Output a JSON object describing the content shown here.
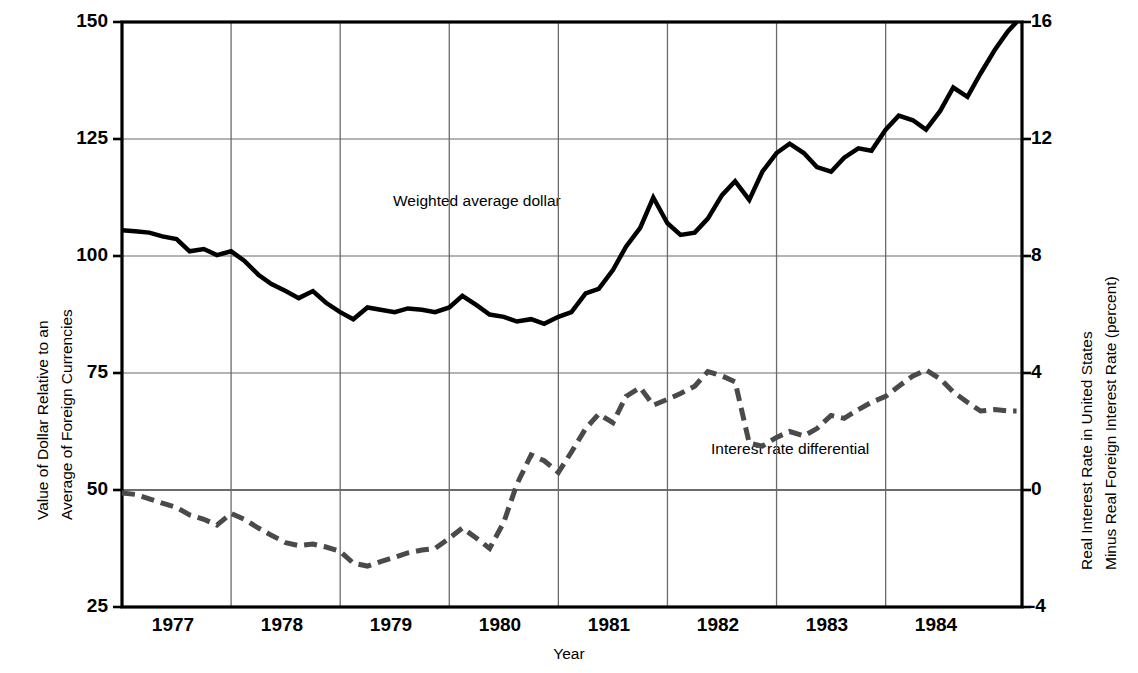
{
  "chart_data": {
    "type": "line",
    "title": "",
    "xlabel": "Year",
    "ylabel_left": "Value of Dollar Relative to an Average of Foreign Currencies",
    "ylabel_left_line1": "Value of Dollar Relative to an",
    "ylabel_left_line2": "Average of Foreign Currencies",
    "ylabel_right": "Real Interest Rate in United States Minus Real Foreign Interest Rate (percent)",
    "ylabel_right_line1": "Real Interest Rate in United States",
    "ylabel_right_line2": "Minus Real Foreign Interest Rate (percent)",
    "xlim": [
      1976.5,
      1984.75
    ],
    "ylim_left": [
      25,
      150
    ],
    "ylim_right": [
      -4,
      16
    ],
    "yticks_left": [
      150,
      125,
      100,
      75,
      50,
      25
    ],
    "yticks_right": [
      16,
      12,
      8,
      4,
      0,
      -4
    ],
    "xticks": [
      1977,
      1978,
      1979,
      1980,
      1981,
      1982,
      1983,
      1984
    ],
    "xtick_labels": [
      "1977",
      "1978",
      "1979",
      "1980",
      "1981",
      "1982",
      "1983",
      "1984"
    ],
    "gridlines": "horizontal at left-axis 50,75,100,125 and vertical at year boundaries",
    "legend": "inline-annotations",
    "series": [
      {
        "name": "Weighted average dollar",
        "axis": "left",
        "style": "solid",
        "color": "#000000",
        "linewidth": 4.5,
        "annotation_label": "Weighted average dollar",
        "x": [
          1976.5,
          1976.62,
          1976.75,
          1976.87,
          1977.0,
          1977.12,
          1977.25,
          1977.37,
          1977.5,
          1977.62,
          1977.75,
          1977.87,
          1978.0,
          1978.12,
          1978.25,
          1978.37,
          1978.5,
          1978.62,
          1978.75,
          1978.87,
          1979.0,
          1979.12,
          1979.25,
          1979.37,
          1979.5,
          1979.62,
          1979.75,
          1979.87,
          1980.0,
          1980.12,
          1980.25,
          1980.37,
          1980.5,
          1980.62,
          1980.75,
          1980.87,
          1981.0,
          1981.12,
          1981.25,
          1981.37,
          1981.5,
          1981.62,
          1981.75,
          1981.87,
          1982.0,
          1982.12,
          1982.25,
          1982.37,
          1982.5,
          1982.62,
          1982.75,
          1982.87,
          1983.0,
          1983.12,
          1983.25,
          1983.37,
          1983.5,
          1983.62,
          1983.75,
          1983.87,
          1984.0,
          1984.12,
          1984.25,
          1984.37,
          1984.5,
          1984.62,
          1984.7
        ],
        "y": [
          105.5,
          105.3,
          105.0,
          104.2,
          103.6,
          101.0,
          101.5,
          100.2,
          101.0,
          99.0,
          96.0,
          94.0,
          92.5,
          91.0,
          92.5,
          90.0,
          88.0,
          86.5,
          89.0,
          88.5,
          88.0,
          88.8,
          88.5,
          88.0,
          89.0,
          91.5,
          89.5,
          87.5,
          87.0,
          86.0,
          86.5,
          85.5,
          87.0,
          88.0,
          92.0,
          93.0,
          97.0,
          102.0,
          106.0,
          112.5,
          107.0,
          104.5,
          105.0,
          108.0,
          113.0,
          116.0,
          112.0,
          118.0,
          122.0,
          124.0,
          122.0,
          119.0,
          118.0,
          121.0,
          123.0,
          122.5,
          127.0,
          130.0,
          129.0,
          127.0,
          131.0,
          136.0,
          134.0,
          139.0,
          144.0,
          148.0,
          150.0
        ]
      },
      {
        "name": "Interest rate differential",
        "axis": "right",
        "style": "dashed",
        "color": "#4a4a4a",
        "linewidth": 5,
        "annotation_label": "Interest rate differential",
        "x": [
          1976.5,
          1976.62,
          1976.75,
          1976.87,
          1977.0,
          1977.12,
          1977.25,
          1977.37,
          1977.5,
          1977.62,
          1977.75,
          1977.87,
          1978.0,
          1978.12,
          1978.25,
          1978.37,
          1978.5,
          1978.62,
          1978.75,
          1978.87,
          1979.0,
          1979.12,
          1979.25,
          1979.37,
          1979.5,
          1979.62,
          1979.75,
          1979.87,
          1980.0,
          1980.12,
          1980.25,
          1980.37,
          1980.5,
          1980.62,
          1980.75,
          1980.87,
          1981.0,
          1981.12,
          1981.25,
          1981.37,
          1981.5,
          1981.62,
          1981.75,
          1981.87,
          1982.0,
          1982.12,
          1982.25,
          1982.37,
          1982.5,
          1982.62,
          1982.75,
          1982.87,
          1983.0,
          1983.12,
          1983.25,
          1983.37,
          1983.5,
          1983.62,
          1983.75,
          1983.87,
          1984.0,
          1984.12,
          1984.25,
          1984.37,
          1984.5,
          1984.62,
          1984.7
        ],
        "y": [
          -0.1,
          -0.15,
          -0.3,
          -0.45,
          -0.6,
          -0.85,
          -1.0,
          -1.2,
          -0.8,
          -1.0,
          -1.3,
          -1.55,
          -1.8,
          -1.9,
          -1.85,
          -1.95,
          -2.1,
          -2.5,
          -2.6,
          -2.45,
          -2.3,
          -2.15,
          -2.05,
          -2.0,
          -1.65,
          -1.3,
          -1.65,
          -2.0,
          -1.1,
          0.2,
          1.2,
          1.0,
          0.6,
          1.3,
          2.1,
          2.6,
          2.3,
          3.2,
          3.5,
          2.9,
          3.1,
          3.3,
          3.55,
          4.05,
          3.9,
          3.7,
          1.6,
          1.5,
          1.8,
          2.0,
          1.85,
          2.1,
          2.55,
          2.45,
          2.75,
          3.0,
          3.2,
          3.55,
          3.9,
          4.1,
          3.8,
          3.35,
          3.0,
          2.7,
          2.75,
          2.7,
          2.7
        ]
      }
    ],
    "annotations": [
      {
        "text": "Weighted average dollar",
        "x_px": 393,
        "y_px": 201
      },
      {
        "text": "Interest rate differential",
        "x_px": 711,
        "y_px": 449
      }
    ]
  },
  "plot_area": {
    "left_px": 122,
    "top_px": 22,
    "right_px": 1022,
    "bottom_px": 607
  },
  "colors": {
    "frame": "#000000",
    "grid": "#6b6b6b",
    "dollar_line": "#000000",
    "differential_line": "#4a4a4a",
    "background": "#ffffff"
  }
}
